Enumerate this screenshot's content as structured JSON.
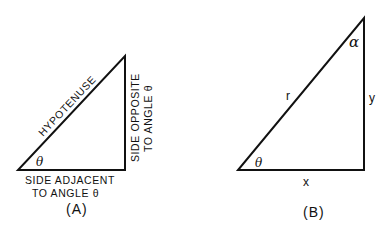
{
  "figure": {
    "panel_a": {
      "caption": "(A)",
      "hypotenuse_label": "HYPOTENUSE",
      "angle_label": "θ",
      "opposite_label_line1": "SIDE OPPOSITE",
      "opposite_label_line2": "TO ANGLE θ",
      "adjacent_label_line1": "SIDE ADJACENT",
      "adjacent_label_line2": "TO ANGLE θ"
    },
    "panel_b": {
      "caption": "(B)",
      "hypotenuse_label": "r",
      "vertical_label": "y",
      "horizontal_label": "x",
      "angle_bottom_label": "θ",
      "angle_top_label": "α"
    },
    "stroke_color": "#111111",
    "background_color": "#ffffff"
  }
}
